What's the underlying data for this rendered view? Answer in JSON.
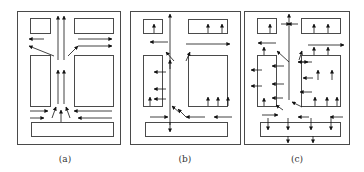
{
  "colors": {
    "stroke": "#4a4a4a",
    "arrow": "#111111",
    "box_fill": "#ffffff",
    "background": "#ffffff"
  },
  "panels": [
    {
      "id": "a",
      "label": "(a)",
      "label_pos": [
        65,
        163
      ],
      "outer": [
        17,
        11,
        103,
        133
      ],
      "boxes": [
        [
          30,
          18,
          20,
          15
        ],
        [
          74,
          18,
          39,
          15
        ],
        [
          30,
          55,
          20,
          51
        ],
        [
          74,
          55,
          39,
          51
        ],
        [
          31,
          122,
          82,
          14
        ]
      ],
      "arrows": [
        [
          58,
          60,
          58,
          16
        ],
        [
          64,
          60,
          64,
          16
        ],
        [
          58,
          104,
          58,
          70
        ],
        [
          64,
          104,
          64,
          70
        ],
        [
          44,
          39,
          29,
          39
        ],
        [
          54,
          56,
          29,
          46
        ],
        [
          78,
          39,
          112,
          39
        ],
        [
          68,
          56,
          78,
          46
        ],
        [
          78,
          46,
          112,
          46
        ],
        [
          30,
          111,
          48,
          111
        ],
        [
          30,
          118,
          44,
          118
        ],
        [
          52,
          118,
          56,
          107
        ],
        [
          61,
          122,
          61,
          110
        ],
        [
          70,
          118,
          66,
          107
        ],
        [
          112,
          111,
          74,
          111
        ],
        [
          112,
          118,
          78,
          118
        ]
      ]
    },
    {
      "id": "b",
      "label": "(b)",
      "label_pos": [
        185,
        163
      ],
      "outer": [
        130,
        11,
        110,
        133
      ],
      "boxes": [
        [
          143,
          19,
          19,
          14
        ],
        [
          188,
          19,
          39,
          14
        ],
        [
          143,
          55,
          19,
          51
        ],
        [
          188,
          55,
          39,
          51
        ],
        [
          145,
          122,
          82,
          14
        ]
      ],
      "arrows": [
        [
          154,
          33,
          154,
          24
        ],
        [
          208,
          33,
          208,
          24
        ],
        [
          222,
          33,
          222,
          24
        ],
        [
          170,
          125,
          170,
          14
        ],
        [
          168,
          42,
          150,
          42
        ],
        [
          186,
          44,
          230,
          44
        ],
        [
          174,
          61,
          166,
          52
        ],
        [
          186,
          61,
          190,
          52
        ],
        [
          170,
          69,
          170,
          60
        ],
        [
          166,
          72,
          154,
          72
        ],
        [
          166,
          89,
          154,
          89
        ],
        [
          166,
          99,
          154,
          99
        ],
        [
          150,
          106,
          150,
          97
        ],
        [
          208,
          106,
          208,
          97
        ],
        [
          218,
          106,
          218,
          97
        ],
        [
          228,
          106,
          228,
          97
        ],
        [
          150,
          117,
          168,
          117
        ],
        [
          180,
          113,
          172,
          106
        ],
        [
          186,
          117,
          178,
          109
        ],
        [
          205,
          117,
          186,
          117
        ],
        [
          232,
          117,
          214,
          117
        ],
        [
          170,
          122,
          170,
          132
        ]
      ]
    },
    {
      "id": "c",
      "label": "(c)",
      "label_pos": [
        297,
        163
      ],
      "outer": [
        244,
        11,
        105,
        133
      ],
      "boxes": [
        [
          257,
          18,
          19,
          15
        ],
        [
          301,
          18,
          39,
          15
        ],
        [
          257,
          55,
          19,
          51
        ],
        [
          301,
          55,
          39,
          51
        ],
        [
          260,
          122,
          80,
          14
        ]
      ],
      "arrows": [
        [
          270,
          33,
          270,
          24
        ],
        [
          281,
          24,
          290,
          24
        ],
        [
          298,
          24,
          288,
          24
        ],
        [
          314,
          33,
          314,
          24
        ],
        [
          328,
          33,
          328,
          24
        ],
        [
          289,
          100,
          289,
          14
        ],
        [
          276,
          43,
          258,
          43
        ],
        [
          308,
          45,
          344,
          45
        ],
        [
          289,
          62,
          277,
          51
        ],
        [
          299,
          60,
          302,
          51
        ],
        [
          264,
          55,
          264,
          47
        ],
        [
          314,
          55,
          314,
          47
        ],
        [
          328,
          55,
          328,
          47
        ],
        [
          262,
          70,
          251,
          70
        ],
        [
          284,
          66,
          272,
          66
        ],
        [
          298,
          62,
          308,
          62
        ],
        [
          312,
          62,
          298,
          62
        ],
        [
          313,
          78,
          303,
          78
        ],
        [
          312,
          92,
          300,
          92
        ],
        [
          262,
          86,
          251,
          86
        ],
        [
          284,
          84,
          272,
          84
        ],
        [
          283,
          98,
          272,
          98
        ],
        [
          318,
          80,
          318,
          70
        ],
        [
          332,
          80,
          332,
          70
        ],
        [
          264,
          106,
          264,
          98
        ],
        [
          315,
          106,
          315,
          97
        ],
        [
          327,
          106,
          327,
          97
        ],
        [
          337,
          106,
          337,
          97
        ],
        [
          262,
          115,
          278,
          115
        ],
        [
          283,
          110,
          276,
          105
        ],
        [
          302,
          107,
          292,
          102
        ],
        [
          309,
          117,
          298,
          117
        ],
        [
          343,
          117,
          330,
          117
        ],
        [
          288,
          118,
          288,
          130
        ],
        [
          311,
          118,
          311,
          130
        ],
        [
          331,
          118,
          331,
          130
        ],
        [
          288,
          136,
          288,
          143
        ],
        [
          313,
          136,
          313,
          143
        ],
        [
          268,
          118,
          268,
          130
        ]
      ]
    }
  ]
}
